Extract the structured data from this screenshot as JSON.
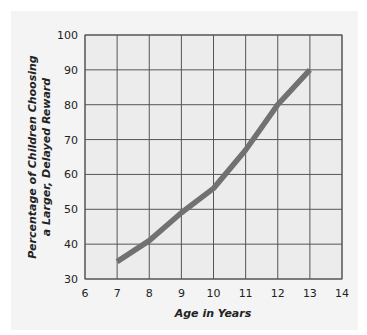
{
  "chart_data": {
    "type": "line",
    "title": "",
    "xlabel": "Age in Years",
    "ylabel_lines": [
      "Percentage of Children Choosing",
      "a Larger, Delayed Reward"
    ],
    "ylabel": "Percentage of Children Choosing a Larger, Delayed Reward",
    "x_ticks": [
      6,
      7,
      8,
      9,
      10,
      11,
      12,
      13,
      14
    ],
    "y_ticks": [
      30,
      40,
      50,
      60,
      70,
      80,
      90,
      100
    ],
    "xlim": [
      6,
      14
    ],
    "ylim": [
      30,
      100
    ],
    "grid": true,
    "legend": null,
    "series": [
      {
        "name": "Children choosing larger, delayed reward",
        "x": [
          7,
          8,
          9,
          10,
          11,
          12,
          13
        ],
        "values": [
          35,
          41,
          49,
          56,
          67,
          80,
          90
        ]
      }
    ]
  },
  "style": {
    "panel_bg": "#f4f4f4",
    "plot_bg": "#ececec",
    "grid_color": "#555555",
    "line_color": "#717171"
  }
}
